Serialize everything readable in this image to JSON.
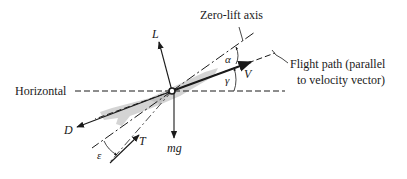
{
  "labels": {
    "zero_lift_axis": "Zero-lift axis",
    "flight_path_line1": "Flight path (parallel",
    "flight_path_line2": "to velocity vector)",
    "horizontal": "Horizontal"
  },
  "forces": {
    "lift": "L",
    "drag": "D",
    "thrust": "T",
    "weight": "mg",
    "velocity": "V"
  },
  "angles": {
    "angle_of_attack": "α",
    "flight_path_angle": "γ",
    "thrust_angle": "ε"
  },
  "colors": {
    "line": "#1a1a1a",
    "aircraft_silhouette": "#c8c8c8"
  }
}
